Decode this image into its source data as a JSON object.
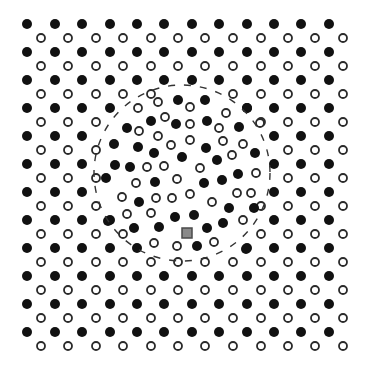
{
  "figure": {
    "width": 370,
    "height": 371,
    "background": "#ffffff"
  },
  "lattice": {
    "filled_color": "#111111",
    "open_stroke": "#2a2a2a",
    "filled_radius": 5,
    "open_radius": 4,
    "filled_columns": [
      27,
      55,
      82,
      110,
      137,
      164,
      192,
      219,
      247,
      274,
      301,
      329
    ],
    "filled_rows": [
      24,
      52,
      80,
      108,
      136,
      164,
      192,
      220,
      248,
      276,
      304,
      332
    ],
    "open_columns": [
      41,
      68,
      96,
      123,
      151,
      178,
      205,
      233,
      261,
      288,
      315,
      343
    ],
    "open_rows": [
      38,
      66,
      94,
      122,
      150,
      178,
      206,
      234,
      262,
      290,
      318,
      346
    ]
  },
  "defect_region": {
    "shape": "dashed-circle",
    "cx": 182,
    "cy": 173,
    "r": 88,
    "stroke": "#333333",
    "disordered_filled": [
      [
        178,
        100
      ],
      [
        205,
        100
      ],
      [
        247,
        108
      ],
      [
        151,
        121
      ],
      [
        176,
        124
      ],
      [
        207,
        121
      ],
      [
        127,
        128
      ],
      [
        239,
        127
      ],
      [
        114,
        144
      ],
      [
        138,
        147
      ],
      [
        154,
        153
      ],
      [
        206,
        148
      ],
      [
        182,
        157
      ],
      [
        255,
        153
      ],
      [
        217,
        160
      ],
      [
        115,
        165
      ],
      [
        130,
        167
      ],
      [
        238,
        174
      ],
      [
        106,
        178
      ],
      [
        155,
        182
      ],
      [
        204,
        183
      ],
      [
        222,
        180
      ],
      [
        139,
        202
      ],
      [
        175,
        217
      ],
      [
        194,
        215
      ],
      [
        229,
        208
      ],
      [
        254,
        208
      ],
      [
        108,
        221
      ],
      [
        134,
        228
      ],
      [
        159,
        227
      ],
      [
        207,
        228
      ],
      [
        223,
        223
      ],
      [
        197,
        246
      ],
      [
        246,
        249
      ]
    ],
    "disordered_open": [
      [
        158,
        102
      ],
      [
        138,
        108
      ],
      [
        190,
        107
      ],
      [
        226,
        113
      ],
      [
        165,
        117
      ],
      [
        190,
        124
      ],
      [
        260,
        123
      ],
      [
        139,
        131
      ],
      [
        219,
        128
      ],
      [
        158,
        136
      ],
      [
        190,
        140
      ],
      [
        223,
        141
      ],
      [
        171,
        145
      ],
      [
        243,
        144
      ],
      [
        232,
        155
      ],
      [
        147,
        167
      ],
      [
        164,
        166
      ],
      [
        200,
        168
      ],
      [
        256,
        173
      ],
      [
        136,
        183
      ],
      [
        177,
        179
      ],
      [
        122,
        197
      ],
      [
        156,
        198
      ],
      [
        172,
        198
      ],
      [
        190,
        194
      ],
      [
        212,
        202
      ],
      [
        237,
        193
      ],
      [
        251,
        193
      ],
      [
        127,
        214
      ],
      [
        151,
        213
      ],
      [
        243,
        220
      ],
      [
        154,
        243
      ],
      [
        177,
        246
      ],
      [
        214,
        242
      ]
    ]
  },
  "probe_marker": {
    "shape": "square",
    "cx": 187,
    "cy": 233,
    "size": 10,
    "fill": "#8a8a8a",
    "stroke": "#4a4a4a"
  }
}
